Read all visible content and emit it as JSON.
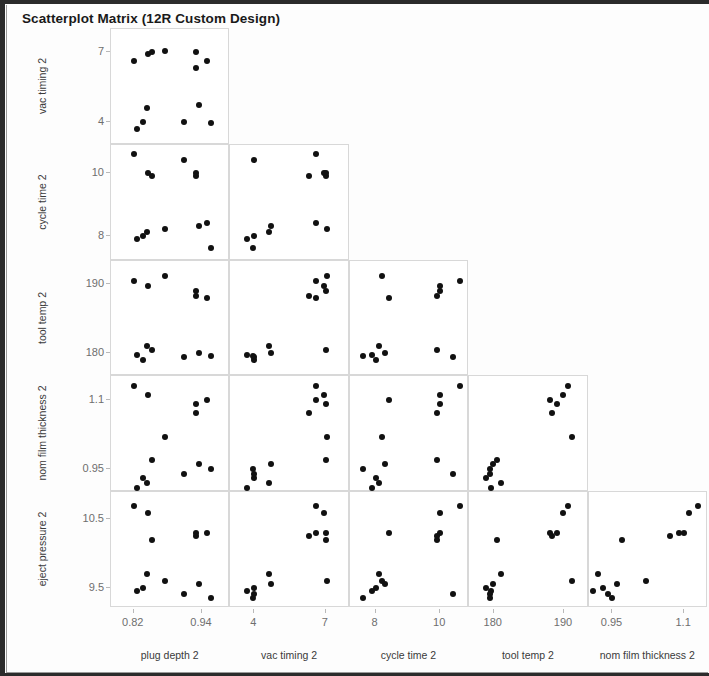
{
  "window": {
    "title": "Scatterplot Matrix (12R Custom Design)"
  },
  "chart_data": {
    "type": "scatter",
    "title": "Scatterplot Matrix (12R Custom Design)",
    "layout": "lower-triangular scatterplot matrix",
    "grid": false,
    "legend": "none",
    "n_points_per_panel": 12,
    "row_variables": [
      "vac timing 2",
      "cycle time 2",
      "tool temp 2",
      "nom film thickness 2",
      "eject pressure 2"
    ],
    "column_variables": [
      "plug depth 2",
      "vac timing 2",
      "cycle time 2",
      "tool temp 2",
      "nom film thickness 2"
    ],
    "axes": {
      "plug depth 2": {
        "ticks": [
          "0.82",
          "0.94"
        ],
        "tick_values": [
          0.82,
          0.94
        ],
        "range": [
          0.78,
          0.99
        ]
      },
      "vac timing 2": {
        "ticks": [
          "4",
          "7"
        ],
        "tick_values": [
          4,
          7
        ],
        "range": [
          3.0,
          8.0
        ]
      },
      "cycle time 2": {
        "ticks": [
          "8",
          "10"
        ],
        "tick_values": [
          8,
          10
        ],
        "range": [
          7.2,
          10.9
        ]
      },
      "tool temp 2": {
        "ticks": [
          "180",
          "190"
        ],
        "tick_values": [
          180,
          190
        ],
        "range": [
          176.5,
          193.5
        ]
      },
      "nom film thickness 2": {
        "ticks": [
          "0.95",
          "1.1"
        ],
        "tick_values": [
          0.95,
          1.1
        ],
        "range": [
          0.9,
          1.15
        ]
      },
      "eject pressure 2": {
        "ticks": [
          "9.5",
          "10.5"
        ],
        "tick_values": [
          9.5,
          10.5
        ],
        "range": [
          9.2,
          10.9
        ]
      }
    },
    "points": [
      {
        "plug depth 2": 0.82,
        "vac timing 2": 6.6,
        "cycle time 2": 10.6,
        "tool temp 2": 190.5,
        "nom film thickness 2": 1.13,
        "eject pressure 2": 10.7
      },
      {
        "plug depth 2": 0.845,
        "vac timing 2": 6.9,
        "cycle time 2": 10.0,
        "tool temp 2": 189.8,
        "nom film thickness 2": 1.11,
        "eject pressure 2": 10.6
      },
      {
        "plug depth 2": 0.852,
        "vac timing 2": 7.0,
        "cycle time 2": 9.9,
        "tool temp 2": 180.4,
        "nom film thickness 2": 0.97,
        "eject pressure 2": 10.2
      },
      {
        "plug depth 2": 0.875,
        "vac timing 2": 7.05,
        "cycle time 2": 8.2,
        "tool temp 2": 191.2,
        "nom film thickness 2": 1.02,
        "eject pressure 2": 9.6
      },
      {
        "plug depth 2": 0.843,
        "vac timing 2": 4.6,
        "cycle time 2": 8.1,
        "tool temp 2": 181.0,
        "nom film thickness 2": 0.92,
        "eject pressure 2": 9.7
      },
      {
        "plug depth 2": 0.836,
        "vac timing 2": 4.0,
        "cycle time 2": 8.0,
        "tool temp 2": 178.9,
        "nom film thickness 2": 0.93,
        "eject pressure 2": 9.5
      },
      {
        "plug depth 2": 0.826,
        "vac timing 2": 3.7,
        "cycle time 2": 7.9,
        "tool temp 2": 179.6,
        "nom film thickness 2": 0.91,
        "eject pressure 2": 9.45
      },
      {
        "plug depth 2": 0.93,
        "vac timing 2": 7.0,
        "cycle time 2": 10.0,
        "tool temp 2": 189.0,
        "nom film thickness 2": 1.09,
        "eject pressure 2": 10.3
      },
      {
        "plug depth 2": 0.93,
        "vac timing 2": 6.3,
        "cycle time 2": 9.9,
        "tool temp 2": 188.3,
        "nom film thickness 2": 1.07,
        "eject pressure 2": 10.25
      },
      {
        "plug depth 2": 0.948,
        "vac timing 2": 6.6,
        "cycle time 2": 8.4,
        "tool temp 2": 188.0,
        "nom film thickness 2": 1.1,
        "eject pressure 2": 10.3
      },
      {
        "plug depth 2": 0.935,
        "vac timing 2": 4.7,
        "cycle time 2": 8.3,
        "tool temp 2": 179.9,
        "nom film thickness 2": 0.96,
        "eject pressure 2": 9.55
      },
      {
        "plug depth 2": 0.908,
        "vac timing 2": 4.0,
        "cycle time 2": 10.4,
        "tool temp 2": 179.4,
        "nom film thickness 2": 0.94,
        "eject pressure 2": 9.4
      },
      {
        "plug depth 2": 0.955,
        "vac timing 2": 3.95,
        "cycle time 2": 7.6,
        "tool temp 2": 179.5,
        "nom film thickness 2": 0.95,
        "eject pressure 2": 9.35
      }
    ]
  },
  "matrix": {
    "rows": [
      {
        "label": "vac timing 2",
        "ticks": [
          "7",
          "4"
        ]
      },
      {
        "label": "cycle time 2",
        "ticks": [
          "10",
          "8"
        ]
      },
      {
        "label": "tool temp 2",
        "ticks": [
          "190",
          "180"
        ]
      },
      {
        "label": "nom film thickness 2",
        "ticks": [
          "1.1",
          "0.95"
        ]
      },
      {
        "label": "eject pressure 2",
        "ticks": [
          "10.5",
          "9.5"
        ]
      }
    ],
    "columns": [
      {
        "label": "plug depth 2",
        "ticks": [
          "0.82",
          "0.94"
        ]
      },
      {
        "label": "vac timing 2",
        "ticks": [
          "4",
          "7"
        ]
      },
      {
        "label": "cycle time 2",
        "ticks": [
          "8",
          "10"
        ]
      },
      {
        "label": "tool temp 2",
        "ticks": [
          "180",
          "190"
        ]
      },
      {
        "label": "nom film thickness 2",
        "ticks": [
          "0.95",
          "1.1"
        ]
      }
    ]
  },
  "style": {
    "dot_color": "#111111",
    "panel_border": "#d8d8d8",
    "tick_text": "#6e6e6e",
    "label_text": "#3a3a3a",
    "title_text": "#191919"
  }
}
